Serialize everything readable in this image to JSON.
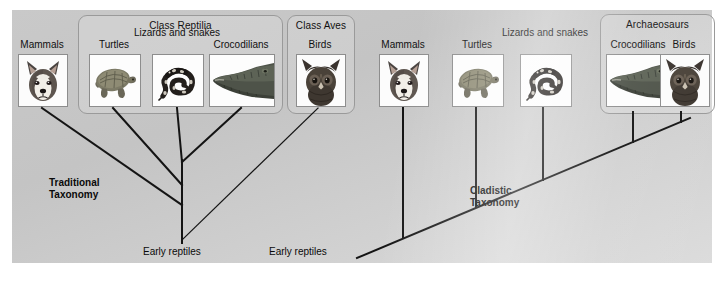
{
  "panel": {
    "background_start": "#c9c9c9",
    "background_end": "#dcdcdc",
    "line_color": "#141414",
    "text_color": "#101010"
  },
  "left_tree": {
    "caption": "Traditional\nTaxonomy",
    "root_label": "Early reptiles",
    "groups": [
      {
        "name": "class-reptilia",
        "title": "Class Reptilia"
      },
      {
        "name": "class-aves",
        "title": "Class Aves"
      }
    ],
    "taxa": [
      {
        "name": "mammals",
        "label": "Mammals",
        "icon": "dog-head-photo"
      },
      {
        "name": "turtles",
        "label": "Turtles",
        "icon": "turtle-photo"
      },
      {
        "name": "lizards",
        "label": "Lizards\nand snakes",
        "icon": "snake-photo"
      },
      {
        "name": "crocodilians",
        "label": "Crocodilians",
        "icon": "crocodile-head-photo"
      },
      {
        "name": "birds",
        "label": "Birds",
        "icon": "owl-head-photo"
      }
    ]
  },
  "right_tree": {
    "caption": "Cladistic\nTaxonomy",
    "root_label": "Early reptiles",
    "groups": [
      {
        "name": "archaeosaurs",
        "title": "Archaeosaurs"
      }
    ],
    "taxa": [
      {
        "name": "mammals",
        "label": "Mammals",
        "icon": "dog-head-photo"
      },
      {
        "name": "turtles",
        "label": "Turtles",
        "icon": "turtle-photo"
      },
      {
        "name": "lizards",
        "label": "Lizards\nand snakes",
        "icon": "snake-photo"
      },
      {
        "name": "crocodilians",
        "label": "Crocodilians",
        "icon": "crocodile-head-photo"
      },
      {
        "name": "birds",
        "label": "Birds",
        "icon": "owl-head-photo"
      }
    ]
  }
}
